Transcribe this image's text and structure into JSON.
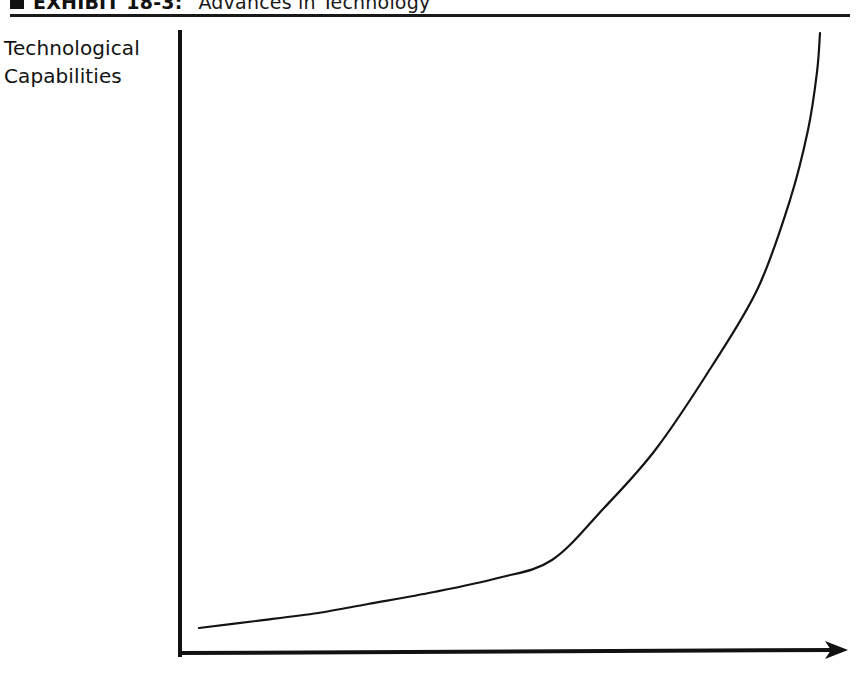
{
  "exhibit": {
    "bullet_icon": "filled-square-bullet-icon",
    "label": "EXHIBIT 18-3:",
    "caption": "Advances in Technology",
    "rule_color": "#1a1a1a"
  },
  "axes": {
    "y_label_line1": "Technological",
    "y_label_line2": "Capabilities",
    "x_label": "",
    "axis_color": "#111111",
    "y_axis": {
      "x": 180,
      "y_top": 32,
      "y_bottom": 656
    },
    "x_axis": {
      "y": 653,
      "x_left": 180,
      "x_right_tip": 848,
      "arrow": true
    }
  },
  "chart_data": {
    "type": "line",
    "title": "Advances in Technology",
    "xlabel": "",
    "ylabel": "Technological Capabilities",
    "grid": false,
    "legend": false,
    "axis_ticks": false,
    "xlim": [
      0,
      1
    ],
    "ylim": [
      0,
      1
    ],
    "series": [
      {
        "name": "Technological capability growth",
        "shape": "exponential",
        "stroke": "#141414",
        "stroke_width": 2.2,
        "x": [
          0.03,
          0.12,
          0.22,
          0.32,
          0.42,
          0.5,
          0.58,
          0.66,
          0.74,
          0.82,
          0.88,
          0.93,
          0.96,
          0.975,
          0.982
        ],
        "y": [
          0.045,
          0.063,
          0.085,
          0.112,
          0.148,
          0.185,
          0.235,
          0.305,
          0.4,
          0.535,
          0.655,
          0.79,
          0.895,
          0.955,
          0.995
        ],
        "points_px": [
          [
            199,
            628
          ],
          [
            256,
            621
          ],
          [
            318,
            613
          ],
          [
            368,
            604
          ],
          [
            434,
            592
          ],
          [
            498,
            578
          ],
          [
            552,
            560
          ],
          [
            604,
            508
          ],
          [
            656,
            449
          ],
          [
            712,
            366
          ],
          [
            758,
            288
          ],
          [
            790,
            200
          ],
          [
            808,
            130
          ],
          [
            817,
            72
          ],
          [
            820,
            33
          ]
        ]
      }
    ],
    "annotations": []
  }
}
